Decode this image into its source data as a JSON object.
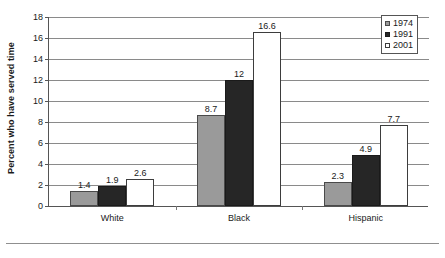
{
  "chart_data": {
    "type": "bar",
    "title": "",
    "xlabel": "",
    "ylabel": "Percent who have served time",
    "categories": [
      "White",
      "Black",
      "Hispanic"
    ],
    "series": [
      {
        "name": "1974",
        "color": "#9a9a9a",
        "values": [
          1.4,
          8.7,
          2.3
        ],
        "labels": [
          "1.4",
          "8.7",
          "2.3"
        ]
      },
      {
        "name": "1991",
        "color": "#262626",
        "values": [
          1.9,
          12,
          4.9
        ],
        "labels": [
          "1.9",
          "12",
          "4.9"
        ]
      },
      {
        "name": "2001",
        "color": "#ffffff",
        "values": [
          2.6,
          16.6,
          7.7
        ],
        "labels": [
          "2.6",
          "16.6",
          "7.7"
        ]
      }
    ],
    "ylim": [
      0,
      18
    ],
    "yticks": [
      0,
      2,
      4,
      6,
      8,
      10,
      12,
      14,
      16,
      18
    ],
    "ytick_labels": [
      "0",
      "2",
      "4",
      "6",
      "8",
      "10",
      "12",
      "14",
      "16",
      "18"
    ],
    "grid": true,
    "legend_position": "top-right"
  },
  "legend": {
    "entries": [
      "1974",
      "1991",
      "2001"
    ]
  }
}
